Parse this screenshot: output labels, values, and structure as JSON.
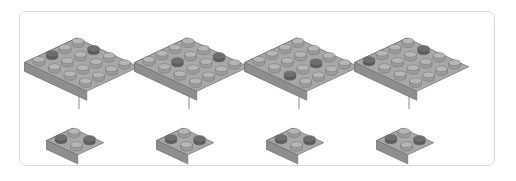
{
  "figure": {
    "title": "",
    "canvas_width": 516,
    "canvas_height": 181,
    "background_color": "#ffffff",
    "border_color": "#d9d9d9",
    "panel_count": 4
  },
  "palette": {
    "plate_top": "#a8a8a8",
    "plate_front": "#8e8e8e",
    "plate_side": "#7f7f7f",
    "plate_edge": "#6f6f6f",
    "stud_light_top": "#b6b6b6",
    "stud_light_side": "#9b9b9b",
    "stud_dark_top": "#6e6e6e",
    "stud_dark_side": "#5c5c5c",
    "stud_outline": "#767676",
    "arrow_color": "#8a8a8a",
    "arrow_head_color": "#4a4a4a"
  },
  "geometry": {
    "big_plate_rows": 4,
    "big_plate_cols": 4,
    "small_plate_rows": 2,
    "small_plate_cols": 2
  },
  "panels": [
    {
      "index": 1,
      "label": "",
      "source_plate": {
        "name": "4x4-plate",
        "rows": 4,
        "cols": 4,
        "dark_studs": [
          [
            2,
            1
          ],
          [
            4,
            2
          ]
        ]
      },
      "arrow": {
        "name": "down-arrow",
        "direction": "down"
      },
      "result_plate": {
        "name": "2x2-plate",
        "rows": 2,
        "cols": 2,
        "dark_studs": [
          [
            1,
            1
          ],
          [
            2,
            2
          ]
        ]
      }
    },
    {
      "index": 2,
      "label": "",
      "source_plate": {
        "name": "4x4-plate",
        "rows": 4,
        "cols": 4,
        "dark_studs": [
          [
            2,
            2
          ],
          [
            4,
            3
          ]
        ]
      },
      "arrow": {
        "name": "down-arrow",
        "direction": "down"
      },
      "result_plate": {
        "name": "2x2-plate",
        "rows": 2,
        "cols": 2,
        "dark_studs": [
          [
            1,
            1
          ],
          [
            2,
            2
          ]
        ]
      }
    },
    {
      "index": 3,
      "label": "",
      "source_plate": {
        "name": "4x4-plate",
        "rows": 4,
        "cols": 4,
        "dark_studs": [
          [
            1,
            3
          ],
          [
            3,
            3
          ]
        ]
      },
      "arrow": {
        "name": "down-arrow",
        "direction": "down"
      },
      "result_plate": {
        "name": "2x2-plate",
        "rows": 2,
        "cols": 2,
        "dark_studs": [
          [
            1,
            1
          ],
          [
            2,
            2
          ]
        ]
      }
    },
    {
      "index": 4,
      "label": "",
      "source_plate": {
        "name": "4x4-plate",
        "rows": 4,
        "cols": 4,
        "dark_studs": [
          [
            1,
            1
          ],
          [
            4,
            2
          ]
        ]
      },
      "arrow": {
        "name": "down-arrow",
        "direction": "down"
      },
      "result_plate": {
        "name": "2x2-plate",
        "rows": 2,
        "cols": 2,
        "dark_studs": [
          [
            1,
            1
          ],
          [
            2,
            2
          ]
        ]
      }
    }
  ]
}
